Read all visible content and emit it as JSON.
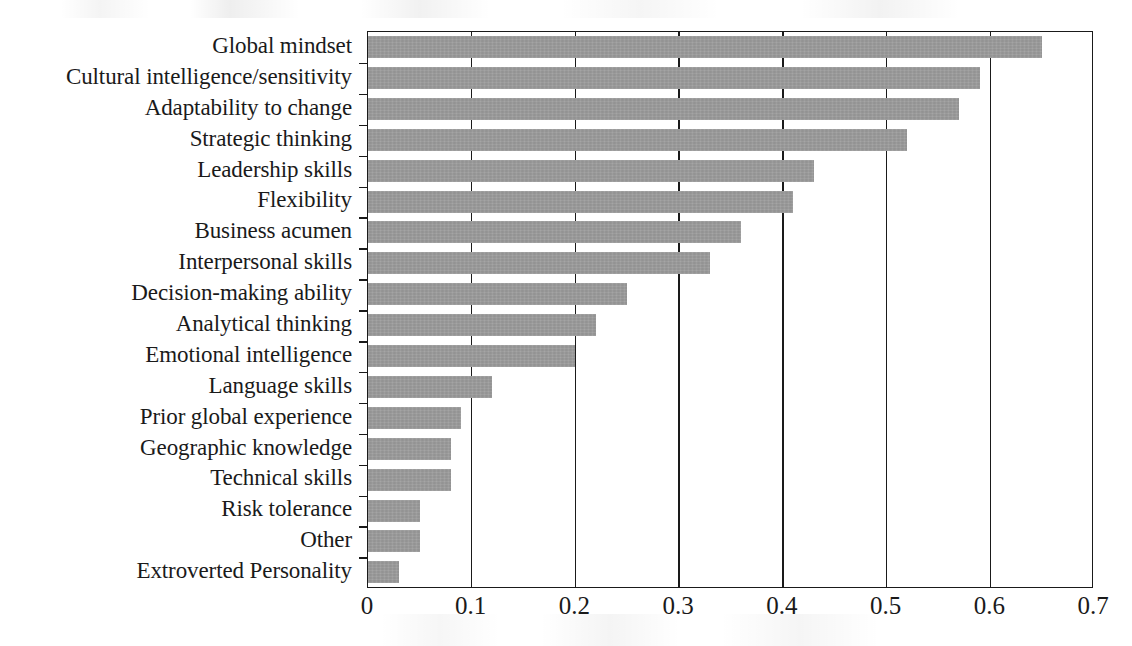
{
  "chart_data": {
    "type": "bar",
    "orientation": "horizontal",
    "title": "",
    "subtitle": "",
    "xlabel": "",
    "ylabel": "",
    "xlim": [
      0,
      0.7
    ],
    "xticks": [
      "0",
      "0.1",
      "0.2",
      "0.3",
      "0.4",
      "0.5",
      "0.6",
      "0.7"
    ],
    "xtick_values": [
      0,
      0.1,
      0.2,
      0.3,
      0.4,
      0.5,
      0.6,
      0.7
    ],
    "grid": "vertical",
    "legend": "none",
    "bar_color": "#9a9a9a",
    "axis_color": "#1a1a1a",
    "categories": [
      "Global mindset",
      "Cultural intelligence/sensitivity",
      "Adaptability to change",
      "Strategic thinking",
      "Leadership skills",
      "Flexibility",
      "Business acumen",
      "Interpersonal skills",
      "Decision-making ability",
      "Analytical thinking",
      "Emotional intelligence",
      "Language skills",
      "Prior global experience",
      "Geographic knowledge",
      "Technical skills",
      "Risk tolerance",
      "Other",
      "Extroverted Personality"
    ],
    "values": [
      0.65,
      0.59,
      0.57,
      0.52,
      0.43,
      0.41,
      0.36,
      0.33,
      0.25,
      0.22,
      0.2,
      0.12,
      0.09,
      0.08,
      0.08,
      0.05,
      0.05,
      0.03
    ]
  }
}
